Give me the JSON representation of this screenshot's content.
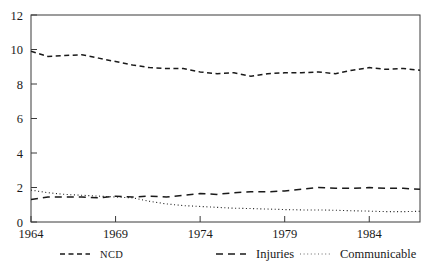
{
  "chart_data": {
    "type": "line",
    "title": "",
    "xlabel": "",
    "ylabel": "",
    "xlim": [
      1964,
      1987
    ],
    "ylim": [
      0,
      12
    ],
    "grid": false,
    "legend_position": "bottom",
    "yticks": [
      0,
      2,
      4,
      6,
      8,
      10,
      12
    ],
    "ytick_labels": [
      "0",
      "2",
      "4",
      "6",
      "8",
      "10",
      "12"
    ],
    "xticks": [
      1964,
      1969,
      1974,
      1979,
      1984
    ],
    "xtick_labels": [
      "1964",
      "1969",
      "1974",
      "1979",
      "1984"
    ],
    "x": [
      1964,
      1965,
      1966,
      1967,
      1968,
      1969,
      1970,
      1971,
      1972,
      1973,
      1974,
      1975,
      1976,
      1977,
      1978,
      1979,
      1980,
      1981,
      1982,
      1983,
      1984,
      1985,
      1986,
      1987
    ],
    "series": [
      {
        "name": "NCD",
        "linestyle": "dashed",
        "color": "#1a1a1a",
        "values": [
          9.9,
          9.6,
          9.65,
          9.7,
          9.5,
          9.3,
          9.1,
          8.95,
          8.9,
          8.9,
          8.7,
          8.6,
          8.65,
          8.45,
          8.6,
          8.65,
          8.65,
          8.7,
          8.6,
          8.8,
          8.95,
          8.85,
          8.9,
          8.8
        ]
      },
      {
        "name": "Injuries",
        "linestyle": "dashed-long",
        "color": "#1a1a1a",
        "values": [
          1.3,
          1.45,
          1.45,
          1.45,
          1.4,
          1.5,
          1.45,
          1.5,
          1.45,
          1.55,
          1.65,
          1.6,
          1.7,
          1.75,
          1.75,
          1.8,
          1.9,
          2.0,
          1.95,
          1.95,
          2.0,
          1.95,
          1.95,
          1.9
        ]
      },
      {
        "name": "Communicable",
        "linestyle": "dotted",
        "color": "#6a6a6a",
        "values": [
          1.85,
          1.7,
          1.6,
          1.55,
          1.5,
          1.45,
          1.4,
          1.2,
          1.05,
          0.95,
          0.9,
          0.85,
          0.8,
          0.78,
          0.75,
          0.72,
          0.7,
          0.7,
          0.68,
          0.65,
          0.63,
          0.6,
          0.6,
          0.62
        ]
      }
    ],
    "legend": [
      {
        "label": "NCD",
        "style": "dashed"
      },
      {
        "label": "Injuries",
        "style": "dashed-long"
      },
      {
        "label": "Communicable",
        "style": "dotted"
      }
    ]
  }
}
